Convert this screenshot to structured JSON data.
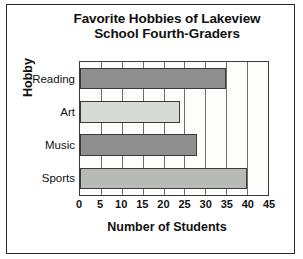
{
  "chart_data": {
    "type": "bar",
    "orientation": "horizontal",
    "title": "Favorite Hobbies of Lakeview School Fourth-Graders",
    "title_line1": "Favorite Hobbies of Lakeview",
    "title_line2": "School Fourth-Graders",
    "xlabel": "Number of Students",
    "ylabel": "Hobby",
    "categories": [
      "Reading",
      "Art",
      "Music",
      "Sports"
    ],
    "values": [
      35,
      24,
      28,
      40
    ],
    "xlim": [
      0,
      45
    ],
    "xticks": [
      0,
      5,
      10,
      15,
      20,
      25,
      30,
      35,
      40,
      45
    ],
    "grid": true,
    "legend": false,
    "bar_colors": [
      "#8f8f8f",
      "#d8dad5",
      "#8f8f8f",
      "#b8bab5"
    ],
    "bars": [
      {
        "category": "Reading",
        "value": 35,
        "color": "#8f8f8f"
      },
      {
        "category": "Art",
        "value": 24,
        "color": "#d8dad5"
      },
      {
        "category": "Music",
        "value": 28,
        "color": "#8f8f8f"
      },
      {
        "category": "Sports",
        "value": 40,
        "color": "#b8bab5"
      }
    ]
  }
}
